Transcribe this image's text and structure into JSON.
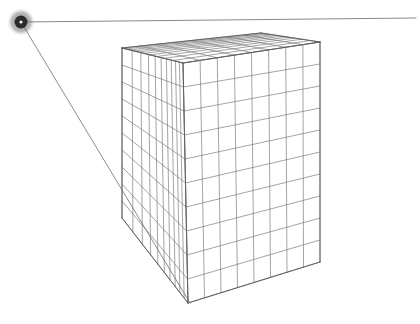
{
  "figure": {
    "background_color": "#ffffff",
    "width": 420,
    "height": 324
  },
  "style": {
    "line_color": "#7d7d7d",
    "edge_color": "#5d5d5d",
    "ray_color": "#6d6d6d",
    "horizon_color": "#6a6a6a",
    "dot_outer_color": "#6e6e6e",
    "dot_mid_color": "#2b2b2b",
    "dot_inner_color": "#f2f2f2",
    "grid_stroke_width": 0.7,
    "edge_stroke_width": 0.95,
    "ray_stroke_width": 0.8
  },
  "vanishing_point": {
    "label": "vanishing-point",
    "x": 21,
    "y": 22,
    "outer_radius": 11,
    "mid_radius": 6.5,
    "inner_radius": 1.6
  },
  "horizon_line": {
    "label": "horizon-line",
    "x1": 21,
    "y1": 22,
    "x2": 416,
    "y2": 18
  },
  "construction_ray": {
    "label": "construction-ray",
    "x1": 21,
    "y1": 22,
    "x2": 190,
    "y2": 303
  },
  "cube": {
    "label": "grid-cube",
    "divisions_width": 8,
    "divisions_height": 10,
    "divisions_depth": 10,
    "corners": {
      "top_front": {
        "x": 183,
        "y": 63
      },
      "top_left_back": {
        "x": 122,
        "y": 48
      },
      "top_right_back": {
        "x": 320,
        "y": 42
      },
      "top_far": {
        "x": 261,
        "y": 33
      },
      "bottom_front": {
        "x": 188,
        "y": 303
      },
      "bottom_left_back": {
        "x": 122,
        "y": 218
      },
      "bottom_right_back": {
        "x": 320,
        "y": 262
      }
    }
  },
  "chart_data": {
    "type": "line",
    "xlabel": "",
    "ylabel": "",
    "elements": [
      {
        "name": "vanishing-point",
        "x": 21,
        "y": 22
      },
      {
        "name": "horizon-line",
        "from": [
          21,
          22
        ],
        "to": [
          416,
          18
        ]
      },
      {
        "name": "construction-ray",
        "from": [
          21,
          22
        ],
        "to": [
          190,
          303
        ]
      },
      {
        "name": "cube-left-face-columns",
        "value": 10
      },
      {
        "name": "cube-left-face-rows",
        "value": 10
      },
      {
        "name": "cube-right-face-columns",
        "value": 8
      },
      {
        "name": "cube-right-face-rows",
        "value": 10
      },
      {
        "name": "cube-top-face-columns",
        "value": 8
      },
      {
        "name": "cube-top-face-rows",
        "value": 10
      }
    ]
  }
}
